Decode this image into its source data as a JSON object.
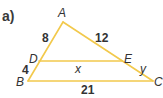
{
  "figure": {
    "part_label": "a)",
    "line_color": "#f2c94c",
    "points": {
      "A": {
        "label": "A",
        "x": 63,
        "y": 22
      },
      "B": {
        "label": "B",
        "x": 28,
        "y": 81
      },
      "C": {
        "label": "C",
        "x": 153,
        "y": 81
      },
      "D": {
        "label": "D",
        "x": 39,
        "y": 61
      },
      "E": {
        "label": "E",
        "x": 122,
        "y": 61
      }
    },
    "segments": [
      {
        "from": "A",
        "to": "B"
      },
      {
        "from": "A",
        "to": "C"
      },
      {
        "from": "B",
        "to": "C"
      },
      {
        "from": "D",
        "to": "E"
      }
    ],
    "measures": {
      "AD": "8",
      "AE": "12",
      "DB": "4",
      "BC": "21",
      "DE": "x",
      "EC": "y"
    }
  }
}
